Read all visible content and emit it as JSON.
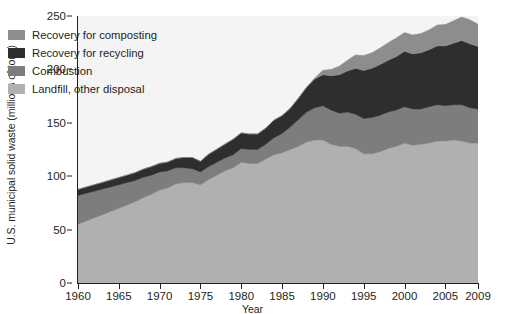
{
  "chart_data": {
    "type": "area",
    "stacked": true,
    "title": "",
    "xlabel": "Year",
    "ylabel": "U.S. municipal solid waste (millions of tons)",
    "xlim": [
      1960,
      2009
    ],
    "ylim": [
      0,
      250
    ],
    "ytick_labels": [
      "0",
      "50",
      "100",
      "150",
      "200",
      "250"
    ],
    "ytick_values": [
      0,
      50,
      100,
      150,
      200,
      250
    ],
    "xtick_labels": [
      "1960",
      "1965",
      "1970",
      "1975",
      "1980",
      "1985",
      "1990",
      "1995",
      "2000",
      "2005",
      "2009"
    ],
    "xtick_values": [
      1960,
      1965,
      1970,
      1975,
      1980,
      1985,
      1990,
      1995,
      2000,
      2005,
      2009
    ],
    "grid": false,
    "legend_position": "upper-left-inside",
    "stack_order_bottom_to_top": [
      "Landfill, other disposal",
      "Combustion",
      "Recovery for recycling",
      "Recovery for composting"
    ],
    "x": [
      1960,
      1961,
      1962,
      1963,
      1964,
      1965,
      1966,
      1967,
      1968,
      1969,
      1970,
      1971,
      1972,
      1973,
      1974,
      1975,
      1976,
      1977,
      1978,
      1979,
      1980,
      1981,
      1982,
      1983,
      1984,
      1985,
      1986,
      1987,
      1988,
      1989,
      1990,
      1991,
      1992,
      1993,
      1994,
      1995,
      1996,
      1997,
      1998,
      1999,
      2000,
      2001,
      2002,
      2003,
      2004,
      2005,
      2006,
      2007,
      2008,
      2009
    ],
    "series": [
      {
        "name": "Landfill, other disposal",
        "color": "#b0b0b0",
        "values": [
          55,
          58,
          61,
          64,
          67,
          70,
          73,
          76,
          80,
          83,
          87,
          89,
          93,
          94,
          94,
          92,
          97,
          101,
          105,
          108,
          113,
          112,
          112,
          116,
          120,
          122,
          125,
          128,
          132,
          134,
          134,
          130,
          128,
          128,
          126,
          121,
          121,
          123,
          126,
          128,
          131,
          129,
          130,
          131,
          133,
          133,
          134,
          133,
          131,
          131
        ]
      },
      {
        "name": "Combustion",
        "color": "#7d7d7d",
        "values": [
          27,
          26,
          25,
          24,
          23,
          22,
          21,
          20,
          19,
          18,
          17,
          16,
          15,
          14,
          13,
          12,
          12,
          12,
          12,
          12,
          13,
          13,
          13,
          14,
          16,
          18,
          21,
          25,
          28,
          30,
          32,
          32,
          31,
          32,
          32,
          33,
          34,
          34,
          34,
          34,
          34,
          34,
          33,
          34,
          34,
          33,
          33,
          34,
          33,
          32
        ]
      },
      {
        "name": "Recovery for recycling",
        "color": "#2e2e2e",
        "values": [
          5.6,
          5.8,
          6.0,
          6.2,
          6.5,
          6.7,
          7.0,
          7.3,
          7.6,
          8.0,
          8.0,
          8.2,
          8.6,
          9.5,
          10.5,
          9.9,
          11.5,
          12.2,
          13.0,
          14.5,
          14.5,
          14.5,
          14.5,
          15.0,
          16.5,
          16.7,
          17.5,
          20.0,
          23.0,
          27.0,
          29.0,
          32.0,
          36.0,
          38.5,
          43.0,
          45.0,
          46.0,
          47.5,
          48.5,
          50.0,
          52.0,
          51.5,
          52.5,
          53.5,
          55.0,
          56.0,
          57.5,
          60.0,
          60.0,
          58.5
        ]
      },
      {
        "name": "Recovery for composting",
        "color": "#8d8d8d",
        "values": [
          0,
          0,
          0,
          0,
          0,
          0,
          0,
          0,
          0,
          0,
          0,
          0,
          0,
          0,
          0,
          0,
          0,
          0,
          0,
          0,
          0,
          0,
          0,
          0,
          0,
          0,
          0,
          0,
          0.5,
          1.0,
          4.2,
          6.0,
          8.0,
          10.0,
          12.5,
          14.0,
          14.5,
          15.5,
          16.5,
          17.5,
          17.5,
          17.8,
          18.0,
          18.5,
          19.5,
          20.0,
          21.0,
          22.0,
          22.5,
          20.8
        ]
      }
    ]
  },
  "legend": {
    "items": [
      {
        "label": "Recovery for composting",
        "color": "#8d8d8d"
      },
      {
        "label": "Recovery for recycling",
        "color": "#2e2e2e"
      },
      {
        "label": "Combustion",
        "color": "#7d7d7d"
      },
      {
        "label": "Landfill, other disposal",
        "color": "#b0b0b0"
      }
    ]
  },
  "axes": {
    "xlabel": "Year",
    "ylabel": "U.S. municipal solid waste (millions of tons)"
  }
}
